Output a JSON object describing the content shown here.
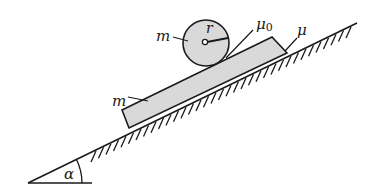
{
  "diagram": {
    "title": "",
    "colors": {
      "ink": "#1a1a1a",
      "fill": "#d9d9d9",
      "background": "#ffffff"
    },
    "incline": {
      "apex": [
        28,
        183
      ],
      "top": [
        357,
        23
      ],
      "base_end": [
        92,
        183
      ],
      "angle_label": "α"
    },
    "block": {
      "label": "m",
      "corners": [
        [
          122,
          110
        ],
        [
          272,
          37
        ],
        [
          287,
          53
        ],
        [
          129,
          128
        ]
      ]
    },
    "cylinder": {
      "label": "m",
      "radius_label": "r",
      "center": [
        206,
        43
      ],
      "radius": 23
    },
    "friction": {
      "cylinder_block": {
        "label": "μ",
        "subscript": "0"
      },
      "block_incline": {
        "label": "μ"
      }
    }
  }
}
